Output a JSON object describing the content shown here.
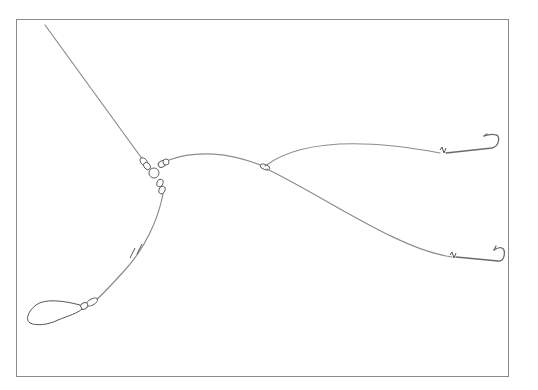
{
  "diagram": {
    "type": "fishing-rig-illustration",
    "components": {
      "main_line": "main-line",
      "swivel": "three-way-swivel",
      "weight_link": "sinker-link",
      "sinker": "sinker",
      "break_mark": "line-break-mark",
      "branch_knot": "dropper-knot",
      "upper_hook": "hook",
      "lower_hook": "hook"
    },
    "colors": {
      "line": "#8c8c8c",
      "outline": "#555555",
      "frame": "#8a8a8a",
      "background": "#ffffff"
    }
  }
}
